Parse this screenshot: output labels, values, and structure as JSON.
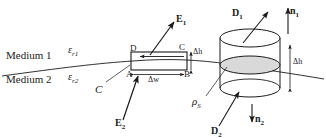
{
  "figure": {
    "background_color": "#ffffff",
    "line_color": "#1a1a1a",
    "shade_color": "#d9d9d9"
  },
  "labels": {
    "medium1": "Medium 1",
    "medium2": "Medium 2",
    "eps_r1": "ε",
    "eps_r1_sub": "r1",
    "eps_r2": "ε",
    "eps_r2_sub": "r2",
    "contour_C": "C",
    "corner_A": "A",
    "corner_B": "B",
    "corner_C": "C",
    "corner_D": "D",
    "delta_w": "Δw",
    "delta_h_left": "Δh",
    "delta_h_right": "Δh",
    "E1": "E",
    "E1_sub": "1",
    "E2": "E",
    "E2_sub": "2",
    "D1": "D",
    "D1_sub": "1",
    "D2": "D",
    "D2_sub": "2",
    "n1": "n",
    "n1_sub": "1",
    "n2": "n",
    "n2_sub": "2",
    "rho_s": "ρ",
    "rho_s_sub": "S"
  },
  "geometry": {
    "interface_curve": "M 2,76 C 60,68 100,63 133,61 C 170,58 200,60 228,64 C 260,69 295,74 324,79",
    "rectangle": {
      "x": 131,
      "y": 52,
      "width": 56,
      "height": 18
    },
    "cylinder": {
      "cx": 250,
      "rx": 30,
      "ry": 9,
      "top_y": 38,
      "mid_y": 65,
      "bottom_y": 88
    }
  }
}
